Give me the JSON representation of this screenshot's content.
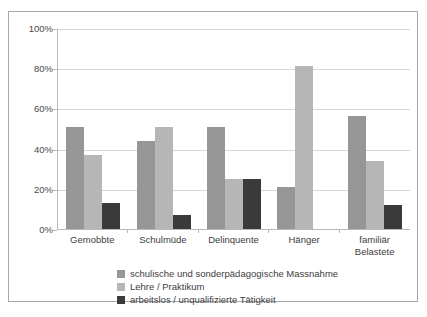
{
  "chart_data": {
    "type": "bar",
    "title": "",
    "subtitle": "",
    "xlabel": "",
    "ylabel": "",
    "ylim": [
      0,
      100
    ],
    "ytick_labels": [
      "100%",
      "80%",
      "60%",
      "40%",
      "20%",
      "0%"
    ],
    "ytick_values": [
      100,
      80,
      60,
      40,
      20,
      0
    ],
    "grid": "horizontal",
    "legend_position": "bottom",
    "categories": [
      "Gemobbte",
      "Schulmüde",
      "Delinquente",
      "Hänger",
      "familiär Belastete"
    ],
    "category_lines": [
      [
        "Gemobbte"
      ],
      [
        "Schulmüde"
      ],
      [
        "Delinquente"
      ],
      [
        "Hänger"
      ],
      [
        "familiär",
        "Belastete"
      ]
    ],
    "series": [
      {
        "name": "schulische und sonderpädagogische Massnahme",
        "color": "#969696",
        "values": [
          51,
          44,
          51,
          21,
          56
        ]
      },
      {
        "name": "Lehre / Praktikum",
        "color": "#b6b6b6",
        "values": [
          37,
          51,
          25,
          81,
          34
        ]
      },
      {
        "name": "arbeitslos / unqualifizierte Tätigkeit",
        "color": "#3a3a3a",
        "values": [
          13,
          7,
          25,
          0,
          12
        ]
      }
    ]
  },
  "frame": {
    "border_color": "#a8a8a8",
    "background": "#ffffff"
  }
}
